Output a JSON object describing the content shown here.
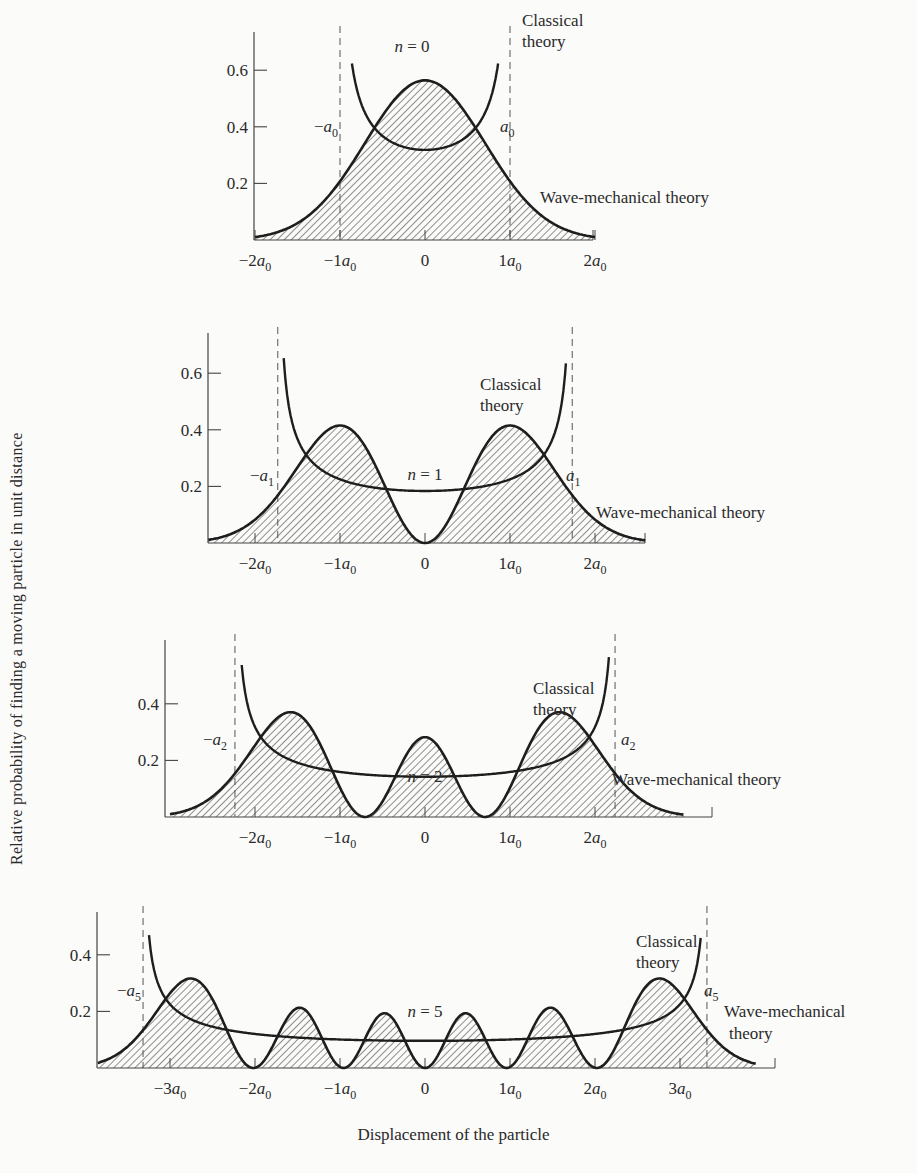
{
  "chart_data": [
    {
      "type": "area",
      "title": "n = 0",
      "xlabel": "Displacement of the particle",
      "ylabel": "Relative probability of finding a moving particle in unit distance",
      "x_unit": "a0",
      "xticks": [
        "-2a0",
        "-1a0",
        "0",
        "1a0",
        "2a0"
      ],
      "yticks": [
        0.2,
        0.4,
        0.6
      ],
      "ylim": [
        0,
        0.7
      ],
      "xlim": [
        -2,
        2.2
      ],
      "classical_turning_points": {
        "label_left": "-a0",
        "label_right": "a0",
        "x": [
          -1.0,
          1.0
        ]
      },
      "series": [
        {
          "name": "Wave-mechanical theory",
          "x": [
            -2,
            -1.5,
            -1,
            -0.5,
            0,
            0.5,
            1,
            1.5,
            2
          ],
          "values": [
            0.01,
            0.06,
            0.21,
            0.44,
            0.56,
            0.44,
            0.21,
            0.06,
            0.01
          ],
          "style": "hatched"
        },
        {
          "name": "Classical theory",
          "x": [
            -0.95,
            -0.7,
            -0.5,
            0,
            0.5,
            0.7,
            0.95
          ],
          "values": [
            0.63,
            0.41,
            0.37,
            0.32,
            0.37,
            0.41,
            0.63
          ]
        }
      ]
    },
    {
      "type": "area",
      "title": "n = 1",
      "xticks": [
        "-2a0",
        "-1a0",
        "0",
        "1a0",
        "2a0"
      ],
      "yticks": [
        0.2,
        0.4,
        0.6
      ],
      "ylim": [
        0,
        0.7
      ],
      "xlim": [
        -2.5,
        2.8
      ],
      "classical_turning_points": {
        "label_left": "-a1",
        "label_right": "a1",
        "x": [
          -1.73,
          1.73
        ]
      },
      "series": [
        {
          "name": "Wave-mechanical theory",
          "x": [
            -2.5,
            -2,
            -1.5,
            -1,
            -0.5,
            0,
            0.5,
            1,
            1.5,
            2,
            2.5
          ],
          "values": [
            0.01,
            0.07,
            0.24,
            0.41,
            0.22,
            0.0,
            0.22,
            0.41,
            0.24,
            0.07,
            0.01
          ],
          "style": "hatched"
        },
        {
          "name": "Classical theory",
          "x": [
            -1.65,
            -1.2,
            -0.5,
            0,
            0.5,
            1.2,
            1.65
          ],
          "values": [
            0.67,
            0.27,
            0.19,
            0.18,
            0.19,
            0.27,
            0.67
          ]
        }
      ]
    },
    {
      "type": "area",
      "title": "n = 2",
      "xticks": [
        "-2a0",
        "-1a0",
        "0",
        "1a0",
        "2a0"
      ],
      "yticks": [
        0.2,
        0.4
      ],
      "ylim": [
        0,
        0.6
      ],
      "xlim": [
        -3,
        3.3
      ],
      "classical_turning_points": {
        "label_left": "-a2",
        "label_right": "a2",
        "x": [
          -2.24,
          2.24
        ]
      },
      "series": [
        {
          "name": "Wave-mechanical theory",
          "x": [
            -3,
            -2.5,
            -1.5,
            -0.71,
            0,
            0.71,
            1.5,
            2.5,
            3
          ],
          "values": [
            0.01,
            0.12,
            0.36,
            0.0,
            0.26,
            0.0,
            0.36,
            0.12,
            0.01
          ],
          "style": "hatched"
        },
        {
          "name": "Classical theory",
          "x": [
            -2.15,
            -1.8,
            -1,
            0,
            1,
            1.8,
            2.15
          ],
          "values": [
            0.57,
            0.27,
            0.18,
            0.16,
            0.18,
            0.27,
            0.57
          ]
        }
      ]
    },
    {
      "type": "area",
      "title": "n = 5",
      "xticks": [
        "-3a0",
        "-2a0",
        "-1a0",
        "0",
        "1a0",
        "2a0",
        "3a0"
      ],
      "yticks": [
        0.2,
        0.4
      ],
      "ylim": [
        0,
        0.5
      ],
      "xlim": [
        -3.8,
        4.1
      ],
      "classical_turning_points": {
        "label_left": "-a5",
        "label_right": "a5",
        "x": [
          -3.32,
          3.32
        ]
      },
      "series": [
        {
          "name": "Wave-mechanical theory",
          "x": [
            -3.8,
            -2.6,
            -1.93,
            -1.5,
            -1.0,
            -0.5,
            0,
            0.5,
            1.0,
            1.5,
            1.93,
            2.6,
            3.8
          ],
          "values": [
            0.01,
            0.27,
            0.0,
            0.2,
            0.0,
            0.15,
            0.0,
            0.15,
            0.0,
            0.2,
            0.0,
            0.27,
            0.01
          ],
          "style": "hatched"
        },
        {
          "name": "Classical theory",
          "x": [
            -3.2,
            -2.5,
            -1.5,
            0,
            1.5,
            2.5,
            3.2
          ],
          "values": [
            0.47,
            0.14,
            0.11,
            0.1,
            0.11,
            0.14,
            0.47
          ]
        }
      ]
    }
  ],
  "panels": [
    {
      "n_label": "n = 0",
      "classical_label_1": "Classical",
      "classical_label_2": "theory",
      "wave_label": "Wave-mechanical theory",
      "a_left": "−a",
      "a_right": "a",
      "a_sub": "0"
    },
    {
      "n_label": "n = 1",
      "classical_label_1": "Classical",
      "classical_label_2": "theory",
      "wave_label": "Wave-mechanical theory",
      "a_left": "−a",
      "a_right": "a",
      "a_sub": "1"
    },
    {
      "n_label": "n = 2",
      "classical_label_1": "Classical",
      "classical_label_2": "theory",
      "wave_label": "Wave-mechanical theory",
      "a_left": "−a",
      "a_right": "a",
      "a_sub": "2"
    },
    {
      "n_label": "n = 5",
      "classical_label_1": "Classical",
      "classical_label_2": "theory",
      "wave_label_1": "Wave-mechanical",
      "wave_label_2": "theory",
      "a_left": "−a",
      "a_right": "a",
      "a_sub": "5"
    }
  ],
  "axes": {
    "ylabel": "Relative probability of finding a moving particle in unit distance",
    "xlabel": "Displacement of the particle"
  },
  "colors": {
    "ink": "#2a2a2a",
    "background": "#fbfbfa"
  }
}
